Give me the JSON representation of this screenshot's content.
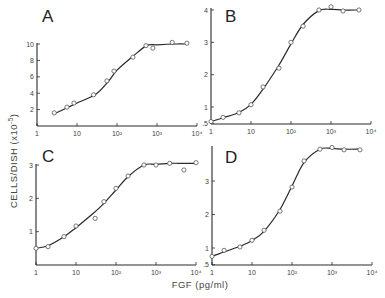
{
  "chart_data": [
    {
      "panel": "A",
      "type": "scatter",
      "xscale": "log",
      "xlabel": "FGF (pg/ml)",
      "ylabel": "CELLS/DISH (x10^-5)",
      "xlim": [
        1,
        10000
      ],
      "ylim": [
        0,
        10
      ],
      "xticks": [
        "1",
        "10",
        "10²",
        "10³",
        "10⁴"
      ],
      "yticks": [
        "2",
        "4",
        "6",
        "8",
        "10"
      ],
      "ytick_values": [
        2,
        4,
        6,
        8,
        10
      ],
      "grid": false,
      "fit_curve": true,
      "x": [
        2.7,
        5.6,
        8.4,
        26,
        56,
        84,
        250,
        530,
        790,
        2400,
        5600
      ],
      "y": [
        1.6,
        2.3,
        2.8,
        3.8,
        5.5,
        6.7,
        8.4,
        9.8,
        9.5,
        10.2,
        10.1
      ],
      "curve_x": [
        2.7,
        5,
        10,
        30,
        60,
        100,
        250,
        550,
        1000,
        3000,
        5600
      ],
      "curve_y": [
        1.5,
        2.1,
        2.8,
        3.9,
        5.4,
        6.8,
        8.5,
        9.8,
        9.9,
        10.0,
        10.0
      ]
    },
    {
      "panel": "B",
      "type": "scatter",
      "xscale": "log",
      "xlabel": "FGF (pg/ml)",
      "ylabel": "CELLS/DISH (x10^-5)",
      "xlim": [
        1,
        10000
      ],
      "ylim": [
        0.5,
        4
      ],
      "xticks": [
        "1",
        "10",
        "10²",
        "10³",
        "10⁴"
      ],
      "yticks": [
        ".5",
        "1",
        "2",
        "3",
        "4"
      ],
      "ytick_values": [
        0.5,
        1,
        2,
        3,
        4
      ],
      "grid": false,
      "fit_curve": true,
      "x": [
        1,
        2,
        5,
        10,
        20,
        50,
        100,
        200,
        500,
        1000,
        2000,
        5000
      ],
      "y": [
        0.55,
        0.68,
        0.82,
        1.07,
        1.62,
        2.2,
        3.0,
        3.5,
        4.0,
        4.1,
        3.97,
        4.0
      ],
      "curve_x": [
        1,
        2,
        5,
        10,
        20,
        50,
        100,
        200,
        500,
        1000,
        2000,
        5000
      ],
      "curve_y": [
        0.55,
        0.67,
        0.83,
        1.08,
        1.55,
        2.3,
        2.95,
        3.55,
        3.98,
        4.02,
        4.0,
        4.0
      ]
    },
    {
      "panel": "C",
      "type": "scatter",
      "xscale": "log",
      "xlabel": "FGF (pg/ml)",
      "ylabel": "CELLS/DISH (x10^-5)",
      "xlim": [
        1,
        10000
      ],
      "ylim": [
        0,
        3
      ],
      "xticks": [
        "1",
        "10",
        "10²",
        "10³",
        "10⁴"
      ],
      "yticks": [
        "1",
        "2",
        "3"
      ],
      "ytick_values": [
        1,
        2,
        3
      ],
      "grid": false,
      "fit_curve": true,
      "x": [
        1,
        2,
        5,
        10,
        30,
        50,
        100,
        200,
        500,
        1000,
        2200,
        5000,
        10000
      ],
      "y": [
        0.5,
        0.55,
        0.85,
        1.17,
        1.4,
        1.9,
        2.3,
        2.67,
        3.0,
        3.0,
        3.05,
        2.85,
        3.07
      ],
      "curve_x": [
        1,
        2,
        5,
        10,
        30,
        50,
        100,
        200,
        500,
        1000,
        2200,
        5000,
        10000
      ],
      "curve_y": [
        0.5,
        0.58,
        0.85,
        1.12,
        1.6,
        1.85,
        2.25,
        2.65,
        3.0,
        3.02,
        3.05,
        3.05,
        3.05
      ]
    },
    {
      "panel": "D",
      "type": "scatter",
      "xscale": "log",
      "xlabel": "FGF (pg/ml)",
      "ylabel": "CELLS/DISH (x10^-5)",
      "xlim": [
        1,
        10000
      ],
      "ylim": [
        0.5,
        4
      ],
      "xticks": [
        "1",
        "10",
        "10²",
        "10³",
        "10⁴"
      ],
      "yticks": [
        ".5",
        "1",
        "2",
        "3"
      ],
      "ytick_values": [
        0.5,
        1,
        2,
        3
      ],
      "grid": false,
      "fit_curve": true,
      "x": [
        1,
        2,
        5,
        10,
        20,
        50,
        100,
        200,
        500,
        1000,
        2000,
        5000
      ],
      "y": [
        0.75,
        0.93,
        1.03,
        1.23,
        1.53,
        2.1,
        2.82,
        3.6,
        3.95,
        4.0,
        3.93,
        3.93
      ],
      "curve_x": [
        1,
        2,
        5,
        10,
        20,
        50,
        100,
        200,
        500,
        1000,
        2000,
        5000
      ],
      "curve_y": [
        0.75,
        0.88,
        1.05,
        1.22,
        1.5,
        2.15,
        2.85,
        3.55,
        3.95,
        3.97,
        3.95,
        3.95
      ]
    }
  ],
  "figure": {
    "ylabel": "CELLS/DISH (x10",
    "ylabel_exp": "-5",
    "ylabel_close": ")",
    "xlabel": "FGF (pg/ml)",
    "ink_color": "#2a2a2a"
  },
  "layout": [
    {
      "x0": 37,
      "x_per_decade": 40,
      "y_axis_bottom": 126,
      "y_ref_val": 0,
      "y_ref_px": 126,
      "y_top_val": 10,
      "y_top_px": 44,
      "axis_top": 43,
      "letter_x": 42,
      "letter_y": 22
    },
    {
      "x0": 211,
      "x_per_decade": 40,
      "y_axis_bottom": 124,
      "y_ref_val": 1,
      "y_ref_px": 107,
      "y_top_val": 4,
      "y_top_px": 10,
      "axis_top": 8,
      "letter_x": 225,
      "letter_y": 22
    },
    {
      "x0": 36,
      "x_per_decade": 40,
      "y_axis_bottom": 265,
      "y_ref_val": 0,
      "y_ref_px": 265,
      "y_top_val": 3,
      "y_top_px": 165,
      "axis_top": 164,
      "letter_x": 42,
      "letter_y": 162
    },
    {
      "x0": 212,
      "x_per_decade": 40,
      "y_axis_bottom": 265,
      "y_ref_val": 1,
      "y_ref_px": 248,
      "y_top_val": 3,
      "y_top_px": 181,
      "axis_top": 146,
      "letter_x": 225,
      "letter_y": 163
    }
  ]
}
